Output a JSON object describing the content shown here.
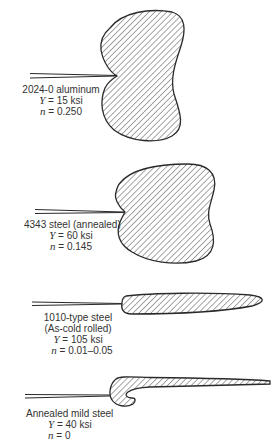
{
  "figure": {
    "specimens": [
      {
        "id": "aluminum",
        "material": "2024-0 aluminum",
        "yield_label": "Y",
        "yield_value": "= 15 ksi",
        "n_label": "n",
        "n_value": "= 0.250"
      },
      {
        "id": "steel-4343",
        "material": "4343 steel (annealed)",
        "yield_label": "Y",
        "yield_value": "= 60 ksi",
        "n_label": "n",
        "n_value": "= 0.145"
      },
      {
        "id": "steel-1010",
        "material": "1010-type steel",
        "condition": "(As-cold rolled)",
        "yield_label": "Y",
        "yield_value": "= 105 ksi",
        "n_label": "n",
        "n_value": "= 0.01–0.05"
      },
      {
        "id": "mild-steel",
        "material": "Annealed mild steel",
        "yield_label": "Y",
        "yield_value": "= 40 ksi",
        "n_label": "n",
        "n_value": "= 0"
      }
    ],
    "colors": {
      "outline": "#2a2a2a",
      "hatch": "#3a3a3a",
      "background": "#ffffff"
    }
  }
}
